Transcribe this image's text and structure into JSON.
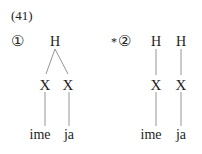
{
  "example_number": "(41)",
  "trees": [
    {
      "label": "①",
      "starred": false,
      "star": "",
      "top_nodes": [
        "H"
      ],
      "mid_nodes": [
        "X",
        "X"
      ],
      "leaves": [
        "ime",
        "ja"
      ],
      "structure": "single H linked to both X"
    },
    {
      "label": "②",
      "starred": true,
      "star": "*",
      "top_nodes": [
        "H",
        "H"
      ],
      "mid_nodes": [
        "X",
        "X"
      ],
      "leaves": [
        "ime",
        "ja"
      ],
      "structure": "each H linked to its own X"
    }
  ]
}
